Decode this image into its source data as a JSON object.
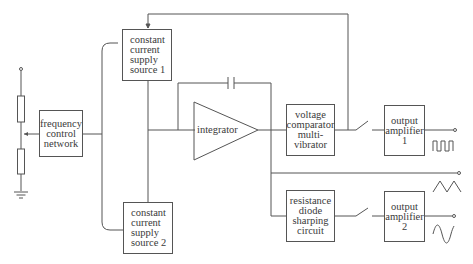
{
  "diagram": {
    "type": "block-diagram",
    "blocks": {
      "freq_control": {
        "lines": [
          "frequency",
          "control",
          "network"
        ]
      },
      "ccs1": {
        "lines": [
          "constant",
          "current",
          "supply",
          "source 1"
        ]
      },
      "ccs2": {
        "lines": [
          "constant",
          "current",
          "supply",
          "source 2"
        ]
      },
      "integrator": {
        "label": "integrator"
      },
      "comparator": {
        "lines": [
          "voltage",
          "comparator",
          "multi-",
          "vibrator"
        ]
      },
      "sharpener": {
        "lines": [
          "resistance",
          "diode",
          "sharping",
          "circuit"
        ]
      },
      "amp1": {
        "lines": [
          "output",
          "amplifier",
          "1"
        ]
      },
      "amp2": {
        "lines": [
          "output",
          "amplifier",
          "2"
        ]
      }
    },
    "outputs": [
      {
        "name": "square-wave-output",
        "waveform": "square"
      },
      {
        "name": "triangle-wave-output",
        "waveform": "triangle"
      },
      {
        "name": "sine-wave-output",
        "waveform": "sine"
      }
    ],
    "components": [
      "potentiometer",
      "resistor",
      "resistor",
      "ground",
      "capacitor",
      "switch",
      "switch"
    ]
  }
}
